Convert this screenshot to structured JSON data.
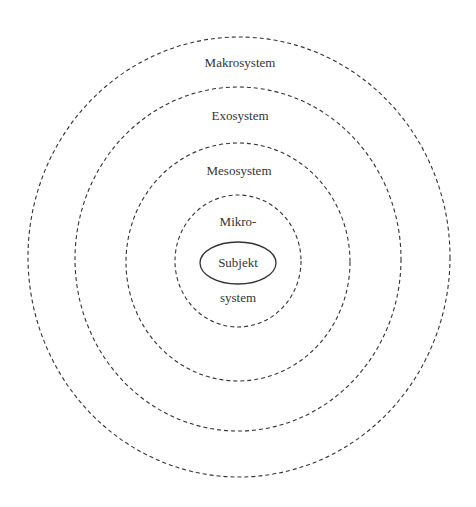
{
  "diagram": {
    "colors": {
      "stroke": "#333333",
      "text": "#333333",
      "background": "#ffffff"
    },
    "rings": [
      {
        "id": "makro",
        "label": "Makrosystem",
        "cx": 239,
        "cy": 257,
        "rx": 211,
        "ry": 220,
        "label_x": 240,
        "label_y": 56
      },
      {
        "id": "exo",
        "label": "Exosystem",
        "cx": 238,
        "cy": 259,
        "rx": 163,
        "ry": 172,
        "label_x": 240,
        "label_y": 109
      },
      {
        "id": "meso",
        "label": "Mesosystem",
        "cx": 238,
        "cy": 262,
        "rx": 112,
        "ry": 119,
        "label_x": 239,
        "label_y": 164
      },
      {
        "id": "mikro",
        "label_top": "Mikro-",
        "label_bottom": "system",
        "cx": 238,
        "cy": 261,
        "rx": 63,
        "ry": 66,
        "label_x": 238,
        "label_top_y": 215,
        "label_bottom_y": 291
      }
    ],
    "subject": {
      "label": "Subjekt",
      "cx": 238,
      "cy": 263,
      "rx": 38,
      "ry": 21
    }
  }
}
